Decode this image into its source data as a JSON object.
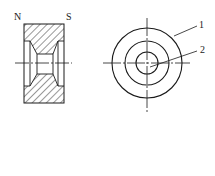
{
  "diagram": {
    "type": "technical-drawing",
    "section_view": {
      "pole_labels": {
        "left": "N",
        "right": "S"
      }
    },
    "end_view": {
      "callouts": [
        {
          "id": "1",
          "label": "1",
          "target": "outer-ring"
        },
        {
          "id": "2",
          "label": "2",
          "target": "inner-bore"
        }
      ]
    }
  },
  "colors": {
    "line": "#1a1a1a",
    "background": "#ffffff"
  }
}
